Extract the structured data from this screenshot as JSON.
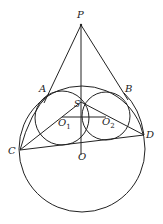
{
  "diagram": {
    "type": "geometry",
    "stroke_color": "#222222",
    "background": "#ffffff",
    "points": {
      "P": {
        "label": "P",
        "x": 81,
        "y": 25
      },
      "A": {
        "label": "A",
        "x": 49,
        "y": 93
      },
      "B": {
        "label": "B",
        "x": 124,
        "y": 92
      },
      "C": {
        "label": "C",
        "x": 20,
        "y": 149
      },
      "D": {
        "label": "D",
        "x": 144,
        "y": 135
      },
      "O": {
        "label": "O",
        "x": 81,
        "y": 149
      },
      "S": {
        "label": "S",
        "x": 81,
        "y": 103
      },
      "O1": {
        "label": "O",
        "sub": "1",
        "x": 63,
        "y": 122
      },
      "O2": {
        "label": "O",
        "sub": "2",
        "x": 105,
        "y": 121
      }
    },
    "circles": [
      {
        "name": "big-circle",
        "center": "O",
        "cx": 82,
        "cy": 146,
        "r": 63
      },
      {
        "name": "circle-o1",
        "center": "O1",
        "cx": 63,
        "cy": 118,
        "r": 26
      },
      {
        "name": "circle-o2",
        "center": "O2",
        "cx": 105,
        "cy": 116,
        "r": 24
      }
    ],
    "segments": [
      "PA",
      "PB",
      "PO",
      "CD",
      "CS",
      "SD",
      "O1O2",
      "CA",
      "BD"
    ]
  }
}
